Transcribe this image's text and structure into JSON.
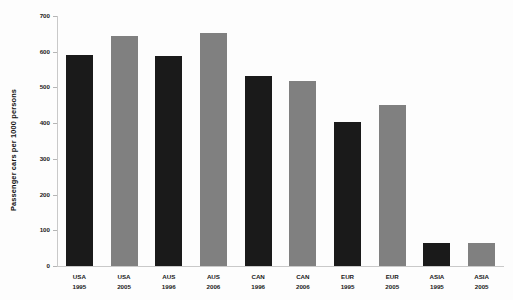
{
  "chart_data": {
    "type": "bar",
    "title": "",
    "xlabel": "",
    "ylabel": "Passenger cars per 1000 persons",
    "ylim": [
      0,
      700
    ],
    "yticks": [
      0,
      100,
      200,
      300,
      400,
      500,
      600,
      700
    ],
    "grid": false,
    "legend": "none",
    "categories": [
      "USA 1995",
      "USA 2005",
      "AUS 1996",
      "AUS 2006",
      "CAN 1996",
      "CAN 2006",
      "EUR 1995",
      "EUR 2005",
      "ASIA 1995",
      "ASIA 2005"
    ],
    "bars": [
      {
        "region": "USA",
        "year": "1995",
        "value": 590,
        "color": "#1a1a1a"
      },
      {
        "region": "USA",
        "year": "2005",
        "value": 644,
        "color": "#808080"
      },
      {
        "region": "AUS",
        "year": "1996",
        "value": 588,
        "color": "#1a1a1a"
      },
      {
        "region": "AUS",
        "year": "2006",
        "value": 652,
        "color": "#808080"
      },
      {
        "region": "CAN",
        "year": "1996",
        "value": 532,
        "color": "#1a1a1a"
      },
      {
        "region": "CAN",
        "year": "2006",
        "value": 518,
        "color": "#808080"
      },
      {
        "region": "EUR",
        "year": "1995",
        "value": 403,
        "color": "#1a1a1a"
      },
      {
        "region": "EUR",
        "year": "2005",
        "value": 451,
        "color": "#808080"
      },
      {
        "region": "ASIA",
        "year": "1995",
        "value": 64,
        "color": "#1a1a1a"
      },
      {
        "region": "ASIA",
        "year": "2005",
        "value": 65,
        "color": "#808080"
      }
    ],
    "values": [
      590,
      644,
      588,
      652,
      532,
      518,
      403,
      451,
      64,
      65
    ],
    "series_colors": {
      "earlier_year": "#1a1a1a",
      "later_year": "#808080"
    },
    "axis_color": "#c9c9c9",
    "background": "#fdfdfd"
  }
}
